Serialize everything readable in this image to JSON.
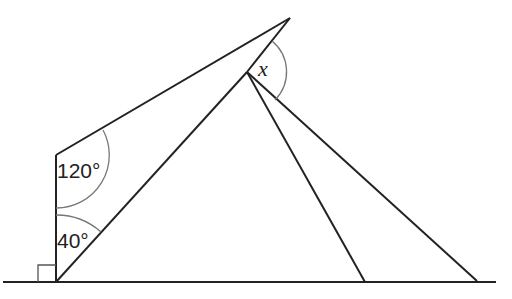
{
  "diagram": {
    "angles": {
      "top_left": "120°",
      "bottom_left": "40°",
      "unknown": "x"
    },
    "right_angle_marker": true,
    "colors": {
      "line": "#222222",
      "arc": "#777777",
      "background": "#ffffff"
    }
  }
}
